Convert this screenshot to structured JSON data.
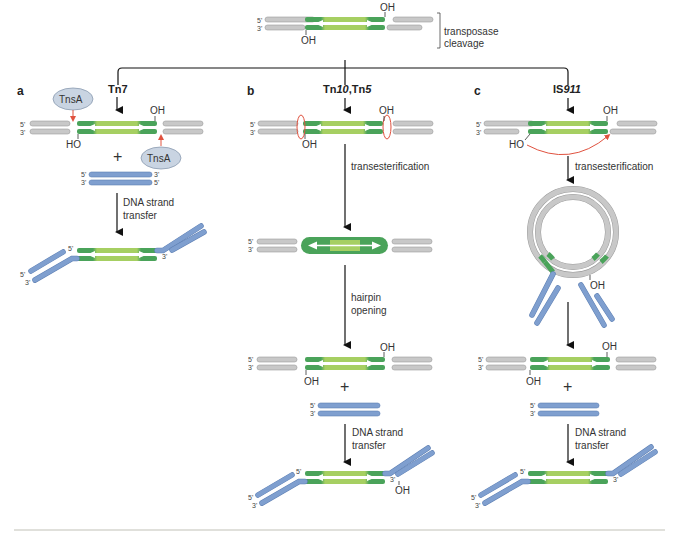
{
  "figure": {
    "top": {
      "label": "transposase cleavage",
      "label_line1": "transposase",
      "label_line2": "cleavage",
      "oh_top": "OH",
      "oh_bottom": "OH",
      "end5": "5'",
      "end3": "3'"
    },
    "panels": [
      {
        "id": "a",
        "letter": "a",
        "transposon": "Tn7",
        "enzyme_top": "TnsA",
        "enzyme_bottom": "TnsA",
        "oh_top": "OH",
        "ho_bottom": "HO",
        "plus": "+",
        "step1_line1": "DNA strand",
        "step1_line2": "transfer",
        "target_5": "5'",
        "target_3": "3'",
        "target_3r": "3'",
        "target_5r": "5'",
        "product_5": "5'",
        "product_3": "3'",
        "product_5b": "5'",
        "product_3b": "3'"
      },
      {
        "id": "b",
        "letter": "b",
        "transposon_a": "Tn",
        "transposon_a_num": "10",
        "transposon_sep": ",Tn",
        "transposon_b_num": "5",
        "oh_top": "OH",
        "oh_bottom": "OH",
        "step1": "transesterification",
        "step2_line1": "hairpin",
        "step2_line2": "opening",
        "oh_top2": "OH",
        "oh_bottom2": "OH",
        "plus": "+",
        "step3_line1": "DNA strand",
        "step3_line2": "transfer",
        "end5": "5'",
        "end3": "3'",
        "product_5": "5'",
        "product_3": "3'",
        "product_5b": "5'",
        "product_3b": "3'",
        "product_oh": "OH"
      },
      {
        "id": "c",
        "letter": "c",
        "transposon_a": "IS",
        "transposon_num": "911",
        "oh_top": "OH",
        "ho_bottom": "HO",
        "step1": "transesterification",
        "circle_oh": "OH",
        "oh_top2": "OH",
        "oh_bottom2": "OH",
        "plus": "+",
        "step3_line1": "DNA strand",
        "step3_line2": "transfer",
        "end5": "5'",
        "end3": "3'",
        "product_5": "5'",
        "product_3": "3'",
        "product_5b": "5'",
        "product_3b": "3'"
      }
    ],
    "colors": {
      "flank_gray": "#c8c8c8",
      "flank_gray_edge": "#9a9a9a",
      "transposon_dark_green": "#4aa35a",
      "transposon_light_green": "#a6cf62",
      "target_blue": "#7f9fcf",
      "target_blue_edge": "#5d7fb3",
      "arrow_red": "#e0523f",
      "enzyme_fill": "#c9d4e2"
    }
  }
}
